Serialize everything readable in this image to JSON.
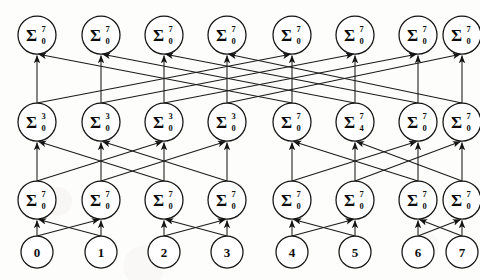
{
  "diagram": {
    "type": "prefix-adder-network",
    "width": 480,
    "height": 280,
    "colors": {
      "background": "#fdfdfb",
      "stroke": "#141414",
      "node_fill": "#ffffff",
      "text": "#0d0d0d"
    },
    "geometry": {
      "node_radius": 19,
      "input_radius": 16,
      "columns_x": [
        37,
        101,
        164,
        227,
        292,
        355,
        418,
        462
      ],
      "rows_y": [
        35,
        122,
        200,
        252
      ]
    },
    "operator_symbol": "Σ",
    "rows": [
      {
        "name": "row-output",
        "row_index": 0,
        "y": 35,
        "nodes": [
          {
            "col": 0,
            "symbol": "Σ",
            "sup": "7",
            "sub": "0",
            "label": "Σ 0..7"
          },
          {
            "col": 1,
            "symbol": "Σ",
            "sup": "7",
            "sub": "0",
            "label": "Σ 0..7"
          },
          {
            "col": 2,
            "symbol": "Σ",
            "sup": "7",
            "sub": "0",
            "label": "Σ 0..7"
          },
          {
            "col": 3,
            "symbol": "Σ",
            "sup": "7",
            "sub": "0",
            "label": "Σ 0..7"
          },
          {
            "col": 4,
            "symbol": "Σ",
            "sup": "7",
            "sub": "0",
            "label": "Σ 0..7"
          },
          {
            "col": 5,
            "symbol": "Σ",
            "sup": "7",
            "sub": "0",
            "label": "Σ 0..7"
          },
          {
            "col": 6,
            "symbol": "Σ",
            "sup": "7",
            "sub": "0",
            "label": "Σ 0..7"
          },
          {
            "col": 7,
            "symbol": "Σ",
            "sup": "7",
            "sub": "0",
            "label": "Σ 0..7"
          }
        ]
      },
      {
        "name": "row-stage3",
        "row_index": 1,
        "y": 122,
        "nodes": [
          {
            "col": 0,
            "symbol": "Σ",
            "sup": "3",
            "sub": "0",
            "label": "Σ 0..3"
          },
          {
            "col": 1,
            "symbol": "Σ",
            "sup": "3",
            "sub": "0",
            "label": "Σ 0..3"
          },
          {
            "col": 2,
            "symbol": "Σ",
            "sup": "3",
            "sub": "0",
            "label": "Σ 0..3"
          },
          {
            "col": 3,
            "symbol": "Σ",
            "sup": "3",
            "sub": "0",
            "label": "Σ 0..3"
          },
          {
            "col": 4,
            "symbol": "Σ",
            "sup": "7",
            "sub": "0",
            "label": "Σ 0..7"
          },
          {
            "col": 5,
            "symbol": "Σ",
            "sup": "7",
            "sub": "4",
            "label": "Σ 4..7"
          },
          {
            "col": 6,
            "symbol": "Σ",
            "sup": "7",
            "sub": "0",
            "label": "Σ 0..7"
          },
          {
            "col": 7,
            "symbol": "Σ",
            "sup": "7",
            "sub": "0",
            "label": "Σ 0..7"
          }
        ]
      },
      {
        "name": "row-stage2",
        "row_index": 2,
        "y": 200,
        "nodes": [
          {
            "col": 0,
            "symbol": "Σ",
            "sup": "7",
            "sub": "0",
            "label": "Σ 0..7"
          },
          {
            "col": 1,
            "symbol": "Σ",
            "sup": "7",
            "sub": "0",
            "label": "Σ 0..7"
          },
          {
            "col": 2,
            "symbol": "Σ",
            "sup": "7",
            "sub": "0",
            "label": "Σ 0..7"
          },
          {
            "col": 3,
            "symbol": "Σ",
            "sup": "7",
            "sub": "0",
            "label": "Σ 0..7"
          },
          {
            "col": 4,
            "symbol": "Σ",
            "sup": "7",
            "sub": "0",
            "label": "Σ 0..7"
          },
          {
            "col": 5,
            "symbol": "Σ",
            "sup": "7",
            "sub": "0",
            "label": "Σ 0..7"
          },
          {
            "col": 6,
            "symbol": "Σ",
            "sup": "7",
            "sub": "0",
            "label": "Σ 0..7"
          },
          {
            "col": 7,
            "symbol": "Σ",
            "sup": "7",
            "sub": "0",
            "label": "Σ 0..7"
          }
        ]
      },
      {
        "name": "row-inputs",
        "row_index": 3,
        "y": 252,
        "nodes": [
          {
            "col": 0,
            "label": "0"
          },
          {
            "col": 1,
            "label": "1"
          },
          {
            "col": 2,
            "label": "2"
          },
          {
            "col": 3,
            "label": "3"
          },
          {
            "col": 4,
            "label": "4"
          },
          {
            "col": 5,
            "label": "5"
          },
          {
            "col": 6,
            "label": "6"
          },
          {
            "col": 7,
            "label": "7"
          }
        ]
      }
    ],
    "edges": {
      "stage_inputs_to_stage2": {
        "name": "stride-1-butterfly",
        "stride": 1,
        "pairs": [
          [
            0,
            0
          ],
          [
            0,
            1
          ],
          [
            1,
            0
          ],
          [
            1,
            1
          ],
          [
            2,
            2
          ],
          [
            2,
            3
          ],
          [
            3,
            2
          ],
          [
            3,
            3
          ],
          [
            4,
            4
          ],
          [
            4,
            5
          ],
          [
            5,
            4
          ],
          [
            5,
            5
          ],
          [
            6,
            6
          ],
          [
            6,
            7
          ],
          [
            7,
            6
          ],
          [
            7,
            7
          ]
        ]
      },
      "stage2_to_stage3": {
        "name": "stride-2-butterfly",
        "stride": 2,
        "pairs": [
          [
            0,
            0
          ],
          [
            0,
            2
          ],
          [
            1,
            1
          ],
          [
            1,
            3
          ],
          [
            2,
            0
          ],
          [
            2,
            2
          ],
          [
            3,
            1
          ],
          [
            3,
            3
          ],
          [
            4,
            4
          ],
          [
            4,
            6
          ],
          [
            5,
            5
          ],
          [
            5,
            7
          ],
          [
            6,
            4
          ],
          [
            6,
            6
          ],
          [
            7,
            5
          ],
          [
            7,
            7
          ]
        ]
      },
      "stage3_to_output": {
        "name": "stride-4-butterfly",
        "stride": 4,
        "pairs": [
          [
            0,
            0
          ],
          [
            0,
            4
          ],
          [
            1,
            1
          ],
          [
            1,
            5
          ],
          [
            2,
            2
          ],
          [
            2,
            6
          ],
          [
            3,
            3
          ],
          [
            3,
            7
          ],
          [
            4,
            0
          ],
          [
            4,
            4
          ],
          [
            5,
            1
          ],
          [
            5,
            5
          ],
          [
            6,
            2
          ],
          [
            6,
            6
          ],
          [
            7,
            3
          ],
          [
            7,
            7
          ]
        ]
      }
    }
  }
}
